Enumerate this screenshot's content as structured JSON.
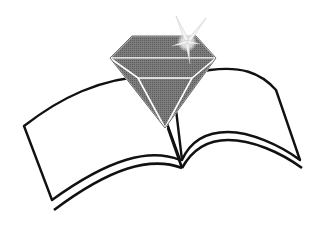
{
  "logo": {
    "description": "Diamond gem above an open book",
    "colors": {
      "background": "#ffffff",
      "outline": "#111111",
      "gem_fill": "#7a7a7a",
      "gem_dark": "#5e5e5e",
      "gem_highlight": "#ffffff"
    }
  }
}
